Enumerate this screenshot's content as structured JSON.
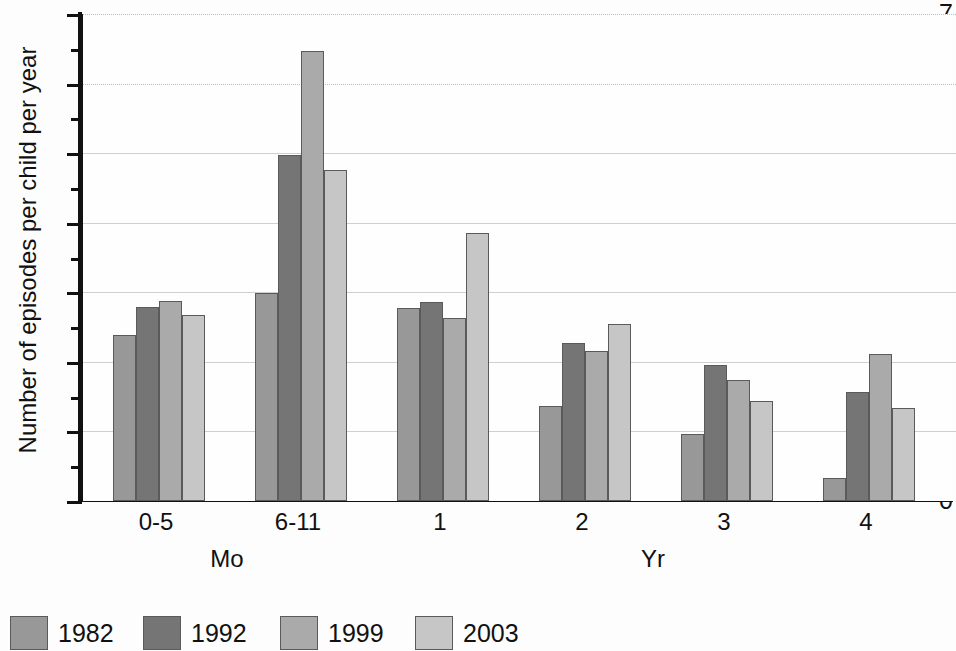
{
  "chart_data": {
    "type": "bar",
    "title": "",
    "subtitle": "",
    "xlabel": "",
    "ylabel": "Number of episodes per child per year",
    "categories": [
      "0-5",
      "6-11",
      "1",
      "2",
      "3",
      "4"
    ],
    "category_units": [
      {
        "label": "Mo",
        "spans": [
          "0-5",
          "6-11"
        ]
      },
      {
        "label": "Yr",
        "spans": [
          "1",
          "2",
          "3",
          "4"
        ]
      }
    ],
    "series": [
      {
        "name": "1982",
        "color": "#989898",
        "values": [
          2.39,
          2.99,
          2.77,
          1.36,
          0.96,
          0.33
        ]
      },
      {
        "name": "1992",
        "color": "#757575",
        "values": [
          2.79,
          4.98,
          2.86,
          2.27,
          1.95,
          1.56
        ]
      },
      {
        "name": "1999",
        "color": "#aaaaaa",
        "values": [
          2.88,
          6.47,
          2.63,
          2.15,
          1.74,
          2.12
        ]
      },
      {
        "name": "2003",
        "color": "#c6c6c6",
        "values": [
          2.68,
          4.76,
          3.85,
          2.54,
          1.44,
          1.34
        ]
      }
    ],
    "ylim": [
      0,
      7
    ],
    "ymajor_ticks": [
      0,
      1,
      2,
      3,
      4,
      5,
      6,
      7
    ],
    "yminor_ticks": [
      0.5,
      1.5,
      2.5,
      3.5,
      4.5,
      5.5,
      6.5
    ],
    "ytick_labels": [
      "0",
      "1",
      "2",
      "3",
      "4",
      "5",
      "6",
      "7"
    ],
    "grid": {
      "horizontal": true,
      "vertical": false,
      "style": "dotted",
      "color": "#bdbdbd"
    },
    "legend": {
      "position": "bottom-left",
      "entries": [
        "1982",
        "1992",
        "1999",
        "2003"
      ]
    },
    "axis_color": "#111111",
    "background": "#fefefe"
  }
}
